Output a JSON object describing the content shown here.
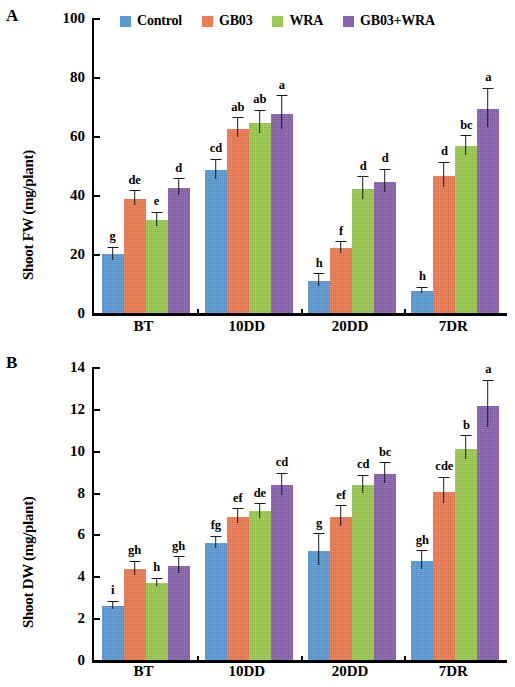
{
  "chart_data": [
    {
      "type": "bar",
      "panel": "A",
      "title": "",
      "xlabel": "",
      "ylabel": "Shoot FW (mg/plant)",
      "categories": [
        "BT",
        "10DD",
        "20DD",
        "7DR"
      ],
      "ylim": [
        0,
        100
      ],
      "yticks": [
        0,
        20,
        40,
        60,
        80,
        100
      ],
      "grid": false,
      "legend_position": "top",
      "series": [
        {
          "name": "Control",
          "color": "#5B9BD5",
          "values": [
            20.0,
            48.5,
            11.0,
            7.5
          ],
          "errors": [
            2.2,
            3.5,
            2.2,
            1.0
          ],
          "letters": [
            "g",
            "cd",
            "h",
            "h"
          ]
        },
        {
          "name": "GB03",
          "color": "#ED7D52",
          "values": [
            38.8,
            62.5,
            22.0,
            46.5
          ],
          "errors": [
            2.5,
            3.5,
            2.0,
            4.5
          ],
          "letters": [
            "de",
            "ab",
            "f",
            "d"
          ]
        },
        {
          "name": "WRA",
          "color": "#9BCB4F",
          "values": [
            31.5,
            64.5,
            42.0,
            56.5
          ],
          "errors": [
            2.5,
            4.0,
            4.0,
            3.5
          ],
          "letters": [
            "e",
            "ab",
            "d",
            "bc"
          ]
        },
        {
          "name": "GB03+WRA",
          "color": "#8A63AF",
          "values": [
            42.5,
            67.5,
            44.5,
            69.0
          ],
          "errors": [
            2.8,
            6.0,
            4.0,
            7.0
          ],
          "letters": [
            "d",
            "a",
            "d",
            "a"
          ]
        }
      ]
    },
    {
      "type": "bar",
      "panel": "B",
      "title": "",
      "xlabel": "",
      "ylabel": "Shoot DW (mg/plant)",
      "categories": [
        "BT",
        "10DD",
        "20DD",
        "7DR"
      ],
      "ylim": [
        0,
        14
      ],
      "yticks": [
        0,
        2,
        4,
        6,
        8,
        10,
        12,
        14
      ],
      "grid": false,
      "legend_position": "top",
      "series": [
        {
          "name": "Control",
          "color": "#5B9BD5",
          "values": [
            2.6,
            5.6,
            5.2,
            4.75
          ],
          "errors": [
            0.18,
            0.3,
            0.8,
            0.45
          ],
          "letters": [
            "i",
            "fg",
            "g",
            "gh"
          ]
        },
        {
          "name": "GB03",
          "color": "#ED7D52",
          "values": [
            4.35,
            6.85,
            6.85,
            8.05
          ],
          "errors": [
            0.35,
            0.35,
            0.5,
            0.65
          ],
          "letters": [
            "gh",
            "ef",
            "ef",
            "cde"
          ]
        },
        {
          "name": "WRA",
          "color": "#9BCB4F",
          "values": [
            3.7,
            7.1,
            8.35,
            10.1
          ],
          "errors": [
            0.18,
            0.35,
            0.45,
            0.6
          ],
          "letters": [
            "h",
            "de",
            "cd",
            "b"
          ]
        },
        {
          "name": "GB03+WRA",
          "color": "#8A63AF",
          "values": [
            4.5,
            8.35,
            8.9,
            12.15
          ],
          "errors": [
            0.4,
            0.55,
            0.5,
            1.2
          ],
          "letters": [
            "gh",
            "cd",
            "bc",
            "a"
          ]
        }
      ]
    }
  ],
  "panels": {
    "a": {
      "letter": "A",
      "ylabel": "Shoot FW (mg/plant)"
    },
    "b": {
      "letter": "B",
      "ylabel": "Shoot DW (mg/plant)"
    }
  },
  "legend": {
    "items": [
      {
        "label": "Control",
        "color": "#5B9BD5"
      },
      {
        "label": "GB03",
        "color": "#ED7D52"
      },
      {
        "label": "WRA",
        "color": "#9BCB4F"
      },
      {
        "label": "GB03+WRA",
        "color": "#8A63AF"
      }
    ]
  }
}
